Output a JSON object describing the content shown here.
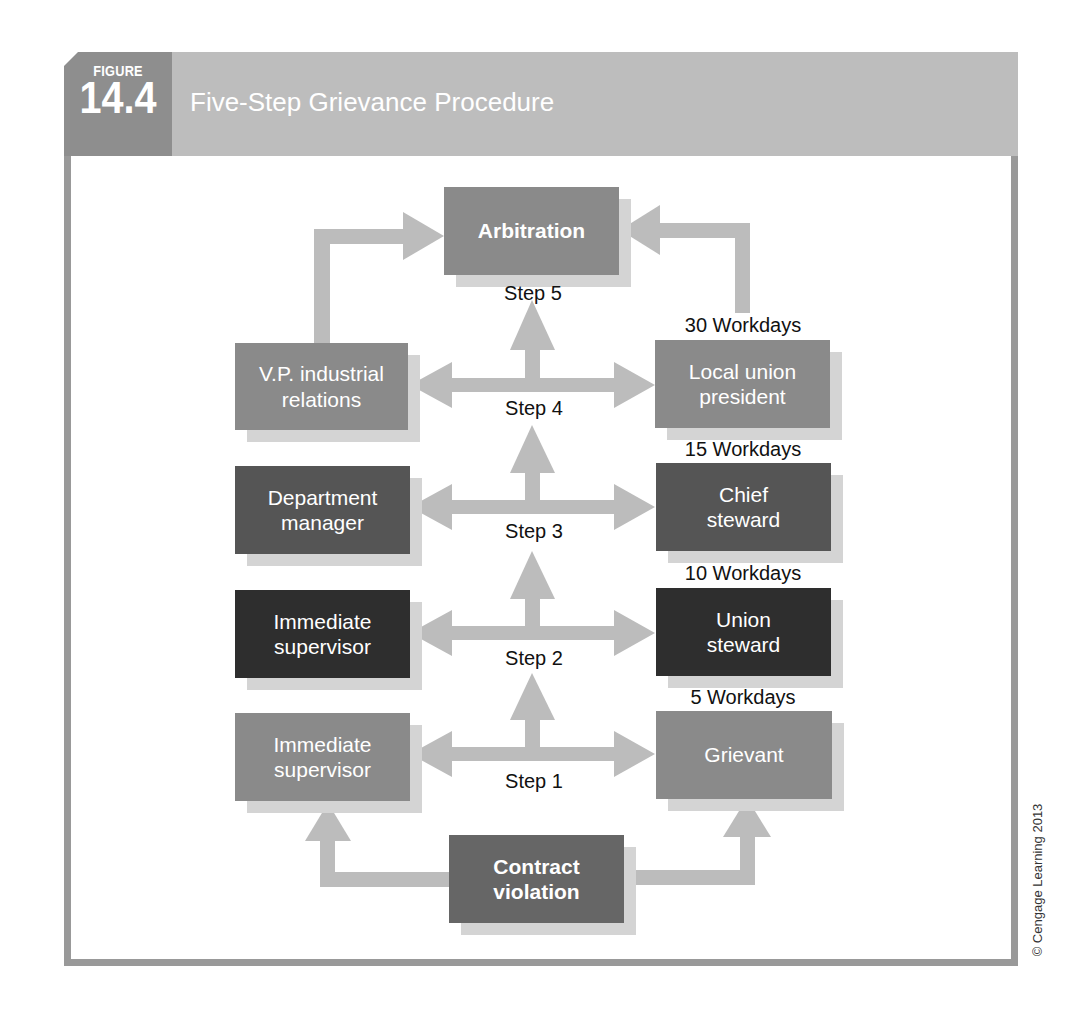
{
  "header": {
    "figure_label": "FIGURE",
    "figure_number": "14.4",
    "title": "Five-Step Grievance Procedure"
  },
  "colors": {
    "header_bar": "#bdbdbd",
    "figure_tab": "#8e8e8e",
    "frame_border": "#999999",
    "arrow": "#bcbcbc",
    "box_shadow": "#d4d4d4",
    "box_light": "#8a8a8a",
    "box_medium": "#555555",
    "box_dark": "#2e2e2e"
  },
  "nodes": {
    "arbitration": "Arbitration",
    "vp_line1": "V.P. industrial",
    "vp_line2": "relations",
    "local_line1": "Local union",
    "local_line2": "president",
    "dept_line1": "Department",
    "dept_line2": "manager",
    "chief_line1": "Chief",
    "chief_line2": "steward",
    "sup2_line1": "Immediate",
    "sup2_line2": "supervisor",
    "union_line1": "Union",
    "union_line2": "steward",
    "sup1_line1": "Immediate",
    "sup1_line2": "supervisor",
    "grievant": "Grievant",
    "contract_line1": "Contract",
    "contract_line2": "violation"
  },
  "steps": {
    "step5": "Step 5",
    "step4": "Step 4",
    "step3": "Step 3",
    "step2": "Step 2",
    "step1": "Step 1"
  },
  "time_limits": {
    "step4_to_5": "30 Workdays",
    "step3_to_4": "15 Workdays",
    "step2_to_3": "10 Workdays",
    "step1_to_2": "5 Workdays"
  },
  "copyright": "© Cengage Learning 2013"
}
